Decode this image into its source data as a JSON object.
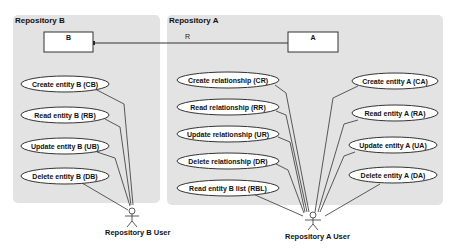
{
  "diagram": {
    "type": "uml-use-case",
    "colors": {
      "panel_fill": "#e3e3e3",
      "box_fill": "#ffffff",
      "ellipse_fill": "#ffffff",
      "stroke": "#333333",
      "text": "#111111"
    },
    "repositories": [
      {
        "id": "B",
        "title": "Repository B",
        "entity": "B",
        "use_cases": [
          "Create entity B (CB)",
          "Read entity B (RB)",
          "Update entity B (UB)",
          "Delete entity B (DB)"
        ],
        "actor": "Repository B User"
      },
      {
        "id": "A",
        "title": "Repository A",
        "entity": "A",
        "relationship_use_cases": [
          "Create relationship (CR)",
          "Read relationship (RR)",
          "Update relationship (UR)",
          "Delete relationship (DR)",
          "Read entity B list (RBL)"
        ],
        "entity_use_cases": [
          "Create entity A (CA)",
          "Read entity A (RA)",
          "Update entity A (UA)",
          "Delete entity A (DA)"
        ],
        "actor": "Repository A User"
      }
    ],
    "association": {
      "label": "R",
      "from": "A",
      "to": "B"
    }
  }
}
